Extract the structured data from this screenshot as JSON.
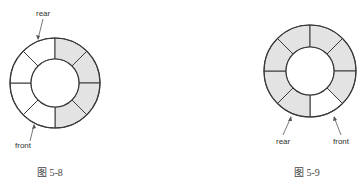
{
  "figures": [
    {
      "id": "fig-5-8",
      "caption": "图 5-8",
      "center": [
        55,
        83
      ],
      "outer_r": 45,
      "inner_r": 24,
      "segments": 8,
      "filled": [
        false,
        true,
        true,
        true,
        true,
        false,
        false,
        false
      ],
      "labels": {
        "top": "rear",
        "bottom": "front"
      }
    },
    {
      "id": "fig-5-9",
      "caption": "图 5-9",
      "center": [
        310,
        71
      ],
      "outer_r": 46,
      "inner_r": 24,
      "segments": 8,
      "filled": [
        true,
        true,
        true,
        true,
        false,
        true,
        true,
        true
      ],
      "labels": {
        "left": "rear",
        "right": "front"
      }
    }
  ],
  "colors": {
    "fill": "#e3e3e3",
    "empty": "#ffffff",
    "stroke": "#3a3a3a"
  }
}
